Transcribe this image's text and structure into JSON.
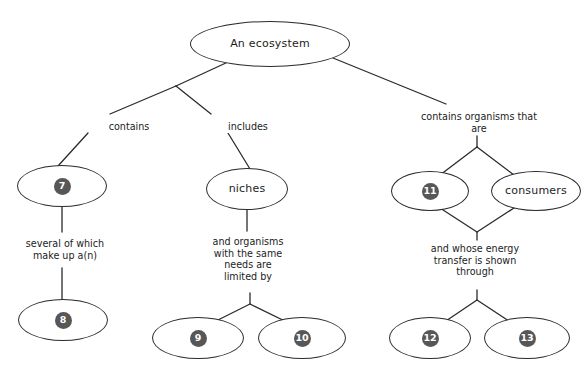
{
  "diagram": {
    "type": "concept-map",
    "nodes": [
      {
        "id": "root",
        "label": "An ecosystem",
        "kind": "text",
        "cx": 270,
        "cy": 44,
        "rx": 80,
        "ry": 23
      },
      {
        "id": "n7",
        "label": "7",
        "kind": "number",
        "cx": 62,
        "cy": 186,
        "rx": 45,
        "ry": 21
      },
      {
        "id": "niches",
        "label": "niches",
        "kind": "text",
        "cx": 247,
        "cy": 189,
        "rx": 41,
        "ry": 21
      },
      {
        "id": "n11",
        "label": "11",
        "kind": "number",
        "cx": 430,
        "cy": 191,
        "rx": 39,
        "ry": 20
      },
      {
        "id": "consumers",
        "label": "consumers",
        "kind": "text",
        "cx": 536,
        "cy": 191,
        "rx": 45,
        "ry": 20
      },
      {
        "id": "n8",
        "label": "8",
        "kind": "number",
        "cx": 63,
        "cy": 320,
        "rx": 45,
        "ry": 21
      },
      {
        "id": "n9",
        "label": "9",
        "kind": "number",
        "cx": 198,
        "cy": 338,
        "rx": 46,
        "ry": 21
      },
      {
        "id": "n10",
        "label": "10",
        "kind": "number",
        "cx": 302,
        "cy": 338,
        "rx": 44,
        "ry": 21
      },
      {
        "id": "n12",
        "label": "12",
        "kind": "number",
        "cx": 430,
        "cy": 338,
        "rx": 41,
        "ry": 21
      },
      {
        "id": "n13",
        "label": "13",
        "kind": "number",
        "cx": 527,
        "cy": 338,
        "rx": 43,
        "ry": 21
      }
    ],
    "edge_labels": [
      {
        "id": "contains",
        "text": "contains",
        "x": 92,
        "y": 121,
        "w": 72
      },
      {
        "id": "includes",
        "text": "includes",
        "x": 211,
        "y": 121,
        "w": 72
      },
      {
        "id": "contains-organisms",
        "text": "contains organisms that\nare",
        "x": 411,
        "y": 111,
        "w": 134
      },
      {
        "id": "several-of-which",
        "text": "several of which\nmake up a(n)",
        "x": 18,
        "y": 238,
        "w": 92
      },
      {
        "id": "and-organisms",
        "text": "and organisms\nwith the same\nneeds are\nlimited by",
        "x": 202,
        "y": 236,
        "w": 90
      },
      {
        "id": "and-whose-energy",
        "text": "and whose energy\ntransfer is shown\nthrough",
        "x": 423,
        "y": 243,
        "w": 102
      }
    ],
    "colors": {
      "stroke": "#2b2b2b",
      "badge_fill": "#575757",
      "badge_text": "#ffffff",
      "text": "#1c1c1c",
      "background": "#ffffff"
    }
  }
}
